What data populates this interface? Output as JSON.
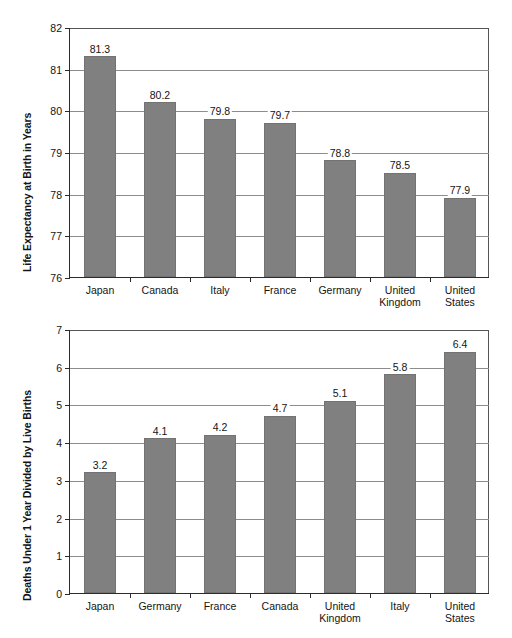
{
  "chart_data": [
    {
      "id": "life-expectancy",
      "type": "bar",
      "title": "",
      "xlabel": "",
      "ylabel": "Life Expectancy at Birth in Years",
      "ylim": [
        76,
        82
      ],
      "yticks": [
        76,
        77,
        78,
        79,
        80,
        81,
        82
      ],
      "ytick_labels": [
        "76",
        "77",
        "78",
        "79",
        "80",
        "81",
        "82"
      ],
      "grid": true,
      "legend": "none",
      "categories": [
        "Japan",
        "Canada",
        "Italy",
        "France",
        "Germany",
        "United Kingdom",
        "United States"
      ],
      "values": [
        81.3,
        80.2,
        79.8,
        79.7,
        78.8,
        78.5,
        77.9
      ],
      "value_labels": [
        "81.3",
        "80.2",
        "79.8",
        "79.7",
        "78.8",
        "78.5",
        "77.9"
      ],
      "bar_color": "#808080"
    },
    {
      "id": "infant-mortality",
      "type": "bar",
      "title": "",
      "xlabel": "",
      "ylabel": "Deaths Under 1 Year Divided by Live Births",
      "ylim": [
        0,
        7
      ],
      "yticks": [
        0,
        1,
        2,
        3,
        4,
        5,
        6,
        7
      ],
      "ytick_labels": [
        "0",
        "1",
        "2",
        "3",
        "4",
        "5",
        "6",
        "7"
      ],
      "grid": true,
      "legend": "none",
      "categories": [
        "Japan",
        "Germany",
        "France",
        "Canada",
        "United Kingdom",
        "Italy",
        "United States"
      ],
      "values": [
        3.2,
        4.1,
        4.2,
        4.7,
        5.1,
        5.8,
        6.4
      ],
      "value_labels": [
        "3.2",
        "4.1",
        "4.2",
        "4.7",
        "5.1",
        "5.8",
        "6.4"
      ],
      "bar_color": "#808080"
    }
  ]
}
